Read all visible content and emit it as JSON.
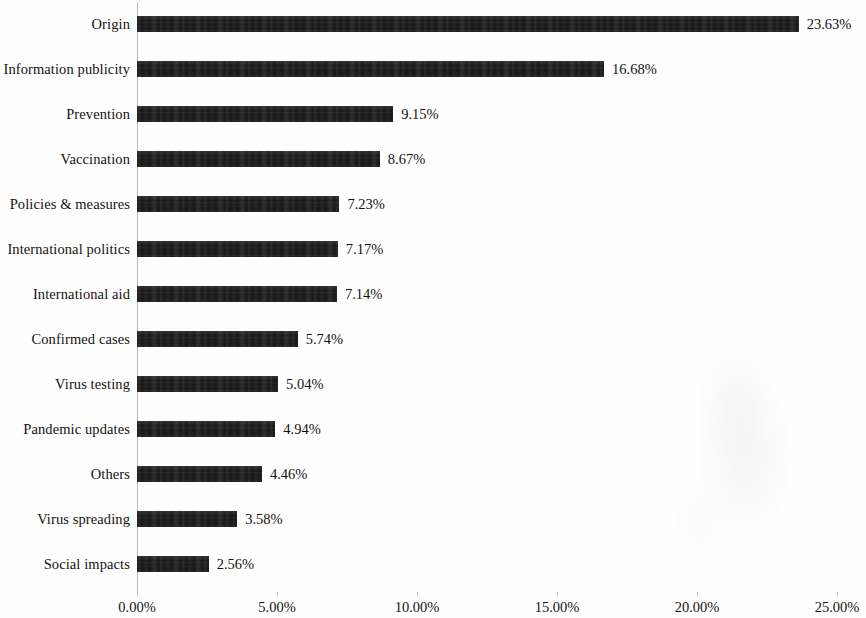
{
  "chart_data": {
    "type": "bar",
    "orientation": "horizontal",
    "title": "",
    "subtitle": "",
    "xlabel": "",
    "ylabel": "",
    "xlim": [
      0,
      25
    ],
    "grid": false,
    "legend": null,
    "bar_color": "#151515",
    "value_label_suffix": "%",
    "categories": [
      "Origin",
      "Information publicity",
      "Prevention",
      "Vaccination",
      "Policies & measures",
      "International politics",
      "International aid",
      "Confirmed cases",
      "Virus testing",
      "Pandemic updates",
      "Others",
      "Virus spreading",
      "Social impacts"
    ],
    "values": [
      23.63,
      16.68,
      9.15,
      8.67,
      7.23,
      7.17,
      7.14,
      5.74,
      5.04,
      4.94,
      4.46,
      3.58,
      2.56
    ],
    "value_labels": [
      "23.63%",
      "16.68%",
      "9.15%",
      "8.67%",
      "7.23%",
      "7.17%",
      "7.14%",
      "5.74%",
      "5.04%",
      "4.94%",
      "4.46%",
      "3.58%",
      "2.56%"
    ],
    "xticks": [
      0,
      5,
      10,
      15,
      20,
      25
    ],
    "xtick_labels": [
      "0.00%",
      "5.00%",
      "10.00%",
      "15.00%",
      "20.00%",
      "25.00%"
    ]
  }
}
